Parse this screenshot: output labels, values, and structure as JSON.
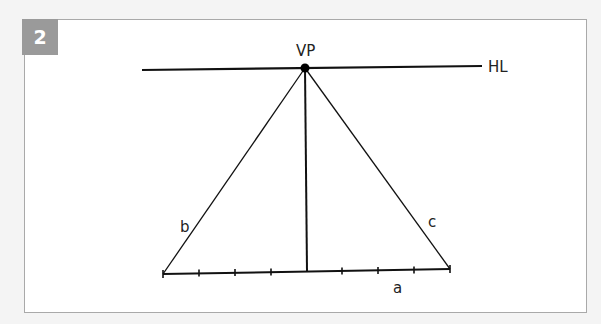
{
  "figure": {
    "number_badge": "2",
    "colors": {
      "background": "#f4f4f4",
      "panel": "#ffffff",
      "panel_border": "#a9a9a9",
      "badge": "#9a9a9a",
      "ink": "#111111"
    }
  },
  "diagram": {
    "labels": {
      "vanishing_point": "VP",
      "horizon_line": "HL",
      "left_edge": "b",
      "right_edge": "c",
      "base_edge": "a"
    },
    "horizon_line": {
      "x1": 142,
      "y1": 70,
      "x2": 482,
      "y2": 66
    },
    "vanishing_point": {
      "x": 305,
      "y": 68,
      "r": 4
    },
    "base_line": {
      "x1": 163,
      "y1": 274,
      "x2": 450,
      "y2": 269
    },
    "vertical_line": {
      "x1": 305,
      "y1": 68,
      "x2": 307,
      "y2": 271
    },
    "base_ticks_x": [
      199,
      235,
      271,
      342,
      378,
      414
    ],
    "tick_count": 8
  }
}
